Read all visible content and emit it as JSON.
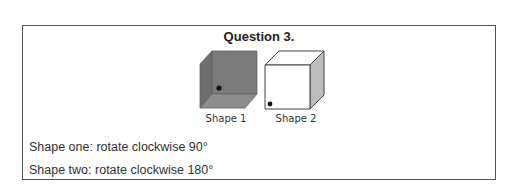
{
  "question": {
    "title": "Question 3.",
    "shapes": [
      {
        "label": "Shape 1",
        "style": "inside-corner-gray",
        "fill": "#808080",
        "dot": "on back face, lower-left"
      },
      {
        "label": "Shape 2",
        "style": "outside-cube-white",
        "fill": "#ffffff",
        "side_fill": "#bdbdbd",
        "dot": "front face, lower-left corner"
      }
    ],
    "instructions": [
      "Shape one: rotate clockwise 90°",
      "Shape two: rotate clockwise 180°"
    ]
  },
  "colors": {
    "border": "#555555",
    "text": "#333333",
    "shape1_gray": "#808080"
  }
}
